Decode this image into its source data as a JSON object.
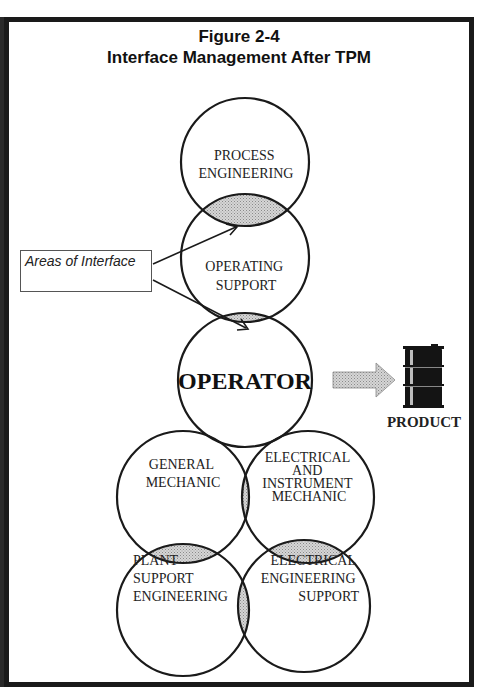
{
  "figure": {
    "number": "Figure 2-4",
    "title": "Interface Management After TPM"
  },
  "callout": {
    "label": "Areas of Interface"
  },
  "circles": {
    "process_engineering": [
      "PROCESS",
      "ENGINEERING"
    ],
    "operating_support": [
      "OPERATING",
      "SUPPORT"
    ],
    "operator": "OPERATOR",
    "general_mechanic": [
      "GENERAL",
      "MECHANIC"
    ],
    "ei_mechanic": [
      "ELECTRICAL",
      "AND",
      "INSTRUMENT",
      "MECHANIC"
    ],
    "plant_support": [
      "PLANT",
      "SUPPORT",
      "ENGINEERING"
    ],
    "electrical_engineering": [
      "ELECTRICAL",
      "ENGINEERING",
      "SUPPORT"
    ]
  },
  "output": {
    "label": "PRODUCT",
    "icon": "oil-barrel-icon"
  },
  "colors": {
    "line": "#1a1a1a",
    "interface_fill": "#c8c8c8",
    "arrow_fill": "#bdbdbd",
    "barrel": "#141414"
  }
}
